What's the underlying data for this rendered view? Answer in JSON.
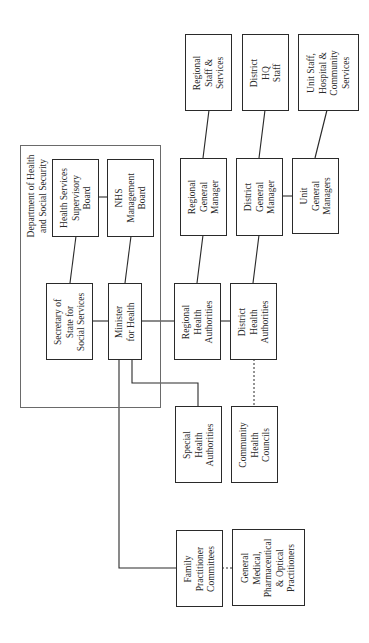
{
  "diagram": {
    "orientation": "rotated 90 degrees counter-clockwise",
    "container": {
      "label": "Department of Health\nand Social Security"
    },
    "nodes": {
      "hssb": "Health Services\nSupervisory\nBoard",
      "nhsmb": "NHS\nManagement\nBoard",
      "sos": "Secretary of\nState for\nSocial Services",
      "minister": "Minister\nfor Health",
      "rha": "Regional\nHealth\nAuthorities",
      "dha": "District\nHealth\nAuthorities",
      "rgm": "Regional\nGeneral\nManager",
      "dgm": "District\nGeneral\nManager",
      "ugm": "Unit\nGeneral\nManagers",
      "rss": "Regional\nStaff &\nServices",
      "dhq": "District\nHQ\nStaff",
      "unit_staff": "Unit Staff,\nHospital &\nCommunity\nServices",
      "sha": "Special\nHealth\nAuthorities",
      "chc": "Community\nHealth\nCouncils",
      "fpc": "Family\nPractitioner\nCommittees",
      "gp": "General\nMedical,\nPharmaceutical\n& Optical\nPractitioners"
    },
    "edges": [
      {
        "from": "hssb",
        "to": "nhsmb",
        "style": "solid"
      },
      {
        "from": "hssb",
        "to": "sos",
        "style": "solid"
      },
      {
        "from": "nhsmb",
        "to": "minister",
        "style": "solid"
      },
      {
        "from": "sos",
        "to": "minister",
        "style": "solid"
      },
      {
        "from": "minister",
        "to": "rha",
        "style": "solid"
      },
      {
        "from": "rha",
        "to": "dha",
        "style": "solid"
      },
      {
        "from": "rha",
        "to": "rgm",
        "style": "solid"
      },
      {
        "from": "dha",
        "to": "dgm",
        "style": "solid"
      },
      {
        "from": "dgm",
        "to": "ugm",
        "style": "solid"
      },
      {
        "from": "rgm",
        "to": "rss",
        "style": "solid"
      },
      {
        "from": "dgm",
        "to": "dhq",
        "style": "solid"
      },
      {
        "from": "ugm",
        "to": "unit_staff",
        "style": "solid"
      },
      {
        "from": "minister",
        "to": "sha",
        "style": "solid"
      },
      {
        "from": "minister",
        "to": "fpc",
        "style": "solid"
      },
      {
        "from": "dha",
        "to": "chc",
        "style": "dashed"
      },
      {
        "from": "fpc",
        "to": "gp",
        "style": "dashed"
      }
    ]
  }
}
